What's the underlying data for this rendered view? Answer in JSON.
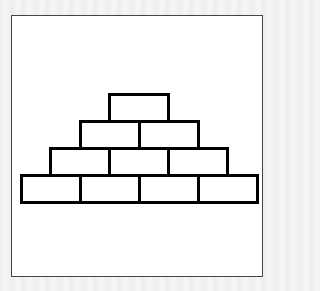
{
  "diagram": {
    "title": "",
    "stroke_color": "#000000",
    "fill_color": "#ffffff",
    "frame_color": "#444444",
    "rows": [
      {
        "index": 1,
        "bricks": 1
      },
      {
        "index": 2,
        "bricks": 2
      },
      {
        "index": 3,
        "bricks": 3
      },
      {
        "index": 4,
        "bricks": 4
      }
    ],
    "total_bricks": 10
  }
}
